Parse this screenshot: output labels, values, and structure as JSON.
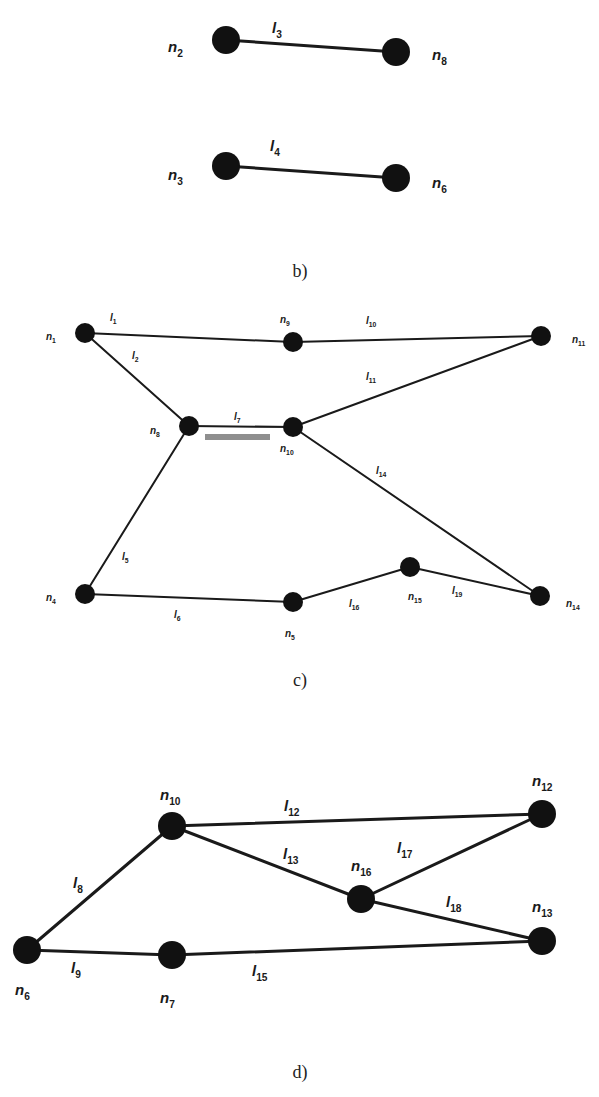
{
  "figure": {
    "panels": [
      {
        "id": "b",
        "caption": "b)",
        "caption_pos": [
          300,
          277
        ],
        "label_size": 15,
        "node_radius": 14,
        "edge_width": 3,
        "nodes": [
          {
            "id": "n2",
            "base": "n",
            "sub": "2",
            "x": 226,
            "y": 40,
            "lx": 168,
            "ly": 52
          },
          {
            "id": "n8",
            "base": "n",
            "sub": "8",
            "x": 396,
            "y": 52,
            "lx": 432,
            "ly": 60
          },
          {
            "id": "n3",
            "base": "n",
            "sub": "3",
            "x": 226,
            "y": 166,
            "lx": 168,
            "ly": 180
          },
          {
            "id": "n6",
            "base": "n",
            "sub": "6",
            "x": 396,
            "y": 178,
            "lx": 432,
            "ly": 188
          }
        ],
        "edges": [
          {
            "id": "l3",
            "base": "l",
            "sub": "3",
            "from": "n2",
            "to": "n8",
            "lx": 272,
            "ly": 33
          },
          {
            "id": "l4",
            "base": "l",
            "sub": "4",
            "from": "n3",
            "to": "n6",
            "lx": 270,
            "ly": 151
          }
        ]
      },
      {
        "id": "c",
        "caption": "c)",
        "caption_pos": [
          300,
          686
        ],
        "label_size": 10,
        "node_radius": 10,
        "edge_width": 2,
        "nodes": [
          {
            "id": "n1",
            "base": "n",
            "sub": "1",
            "x": 85,
            "y": 333,
            "lx": 46,
            "ly": 340
          },
          {
            "id": "n9",
            "base": "n",
            "sub": "9",
            "x": 293,
            "y": 342,
            "lx": 280,
            "ly": 323
          },
          {
            "id": "n11",
            "base": "n",
            "sub": "11",
            "x": 541,
            "y": 336,
            "lx": 572,
            "ly": 343
          },
          {
            "id": "n8",
            "base": "n",
            "sub": "8",
            "x": 189,
            "y": 426,
            "lx": 150,
            "ly": 434
          },
          {
            "id": "n10",
            "base": "n",
            "sub": "10",
            "x": 293,
            "y": 427,
            "lx": 280,
            "ly": 452
          },
          {
            "id": "n4",
            "base": "n",
            "sub": "4",
            "x": 85,
            "y": 594,
            "lx": 46,
            "ly": 601
          },
          {
            "id": "n5",
            "base": "n",
            "sub": "5",
            "x": 293,
            "y": 602,
            "lx": 285,
            "ly": 637
          },
          {
            "id": "n15",
            "base": "n",
            "sub": "15",
            "x": 410,
            "y": 567,
            "lx": 408,
            "ly": 600
          },
          {
            "id": "n14",
            "base": "n",
            "sub": "14",
            "x": 540,
            "y": 596,
            "lx": 566,
            "ly": 607
          }
        ],
        "edges": [
          {
            "id": "l1",
            "base": "l",
            "sub": "1",
            "from": "n1",
            "to": "n9",
            "lx": 110,
            "ly": 321
          },
          {
            "id": "l10",
            "base": "l",
            "sub": "10",
            "from": "n9",
            "to": "n11",
            "lx": 366,
            "ly": 324
          },
          {
            "id": "l2",
            "base": "l",
            "sub": "2",
            "from": "n1",
            "to": "n8",
            "lx": 132,
            "ly": 359
          },
          {
            "id": "l11",
            "base": "l",
            "sub": "11",
            "from": "n10",
            "to": "n11",
            "lx": 366,
            "ly": 380
          },
          {
            "id": "l7",
            "base": "l",
            "sub": "7",
            "from": "n8",
            "to": "n10",
            "lx": 234,
            "ly": 420
          },
          {
            "id": "l14",
            "base": "l",
            "sub": "14",
            "from": "n10",
            "to": "n14",
            "lx": 376,
            "ly": 474
          },
          {
            "id": "l5",
            "base": "l",
            "sub": "5",
            "from": "n8",
            "to": "n4",
            "lx": 122,
            "ly": 560
          },
          {
            "id": "l6",
            "base": "l",
            "sub": "6",
            "from": "n4",
            "to": "n5",
            "lx": 174,
            "ly": 618
          },
          {
            "id": "l16",
            "base": "l",
            "sub": "16",
            "from": "n5",
            "to": "n15",
            "lx": 349,
            "ly": 607
          },
          {
            "id": "l19",
            "base": "l",
            "sub": "19",
            "from": "n15",
            "to": "n14",
            "lx": 452,
            "ly": 594
          }
        ],
        "highlight_bar": {
          "x": 205,
          "y": 434,
          "w": 65,
          "h": 6,
          "color": "#8f8f8f"
        }
      },
      {
        "id": "d",
        "caption": "d)",
        "caption_pos": [
          300,
          1078
        ],
        "label_size": 15,
        "node_radius": 14,
        "edge_width": 3,
        "nodes": [
          {
            "id": "n10",
            "base": "n",
            "sub": "10",
            "x": 172,
            "y": 826,
            "lx": 160,
            "ly": 800
          },
          {
            "id": "n12",
            "base": "n",
            "sub": "12",
            "x": 542,
            "y": 814,
            "lx": 532,
            "ly": 786
          },
          {
            "id": "n16",
            "base": "n",
            "sub": "16",
            "x": 361,
            "y": 899,
            "lx": 351,
            "ly": 871
          },
          {
            "id": "n13",
            "base": "n",
            "sub": "13",
            "x": 542,
            "y": 941,
            "lx": 532,
            "ly": 912
          },
          {
            "id": "n6",
            "base": "n",
            "sub": "6",
            "x": 27,
            "y": 950,
            "lx": 15,
            "ly": 995
          },
          {
            "id": "n7",
            "base": "n",
            "sub": "7",
            "x": 172,
            "y": 955,
            "lx": 160,
            "ly": 1003
          }
        ],
        "edges": [
          {
            "id": "l12",
            "base": "l",
            "sub": "12",
            "from": "n10",
            "to": "n12",
            "lx": 284,
            "ly": 811
          },
          {
            "id": "l13",
            "base": "l",
            "sub": "13",
            "from": "n10",
            "to": "n16",
            "lx": 283,
            "ly": 859
          },
          {
            "id": "l17",
            "base": "l",
            "sub": "17",
            "from": "n16",
            "to": "n12",
            "lx": 397,
            "ly": 853
          },
          {
            "id": "l18",
            "base": "l",
            "sub": "18",
            "from": "n16",
            "to": "n13",
            "lx": 446,
            "ly": 907
          },
          {
            "id": "l8",
            "base": "l",
            "sub": "8",
            "from": "n6",
            "to": "n10",
            "lx": 73,
            "ly": 888
          },
          {
            "id": "l9",
            "base": "l",
            "sub": "9",
            "from": "n6",
            "to": "n7",
            "lx": 71,
            "ly": 973
          },
          {
            "id": "l15",
            "base": "l",
            "sub": "15",
            "from": "n7",
            "to": "n13",
            "lx": 252,
            "ly": 976
          }
        ]
      }
    ]
  }
}
